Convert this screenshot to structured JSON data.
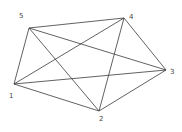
{
  "diagram": {
    "type": "complete-graph",
    "nodes": [
      {
        "id": "1",
        "label": "1",
        "x": 14,
        "y": 84,
        "lx": 9,
        "ly": 98
      },
      {
        "id": "2",
        "label": "2",
        "x": 99,
        "y": 111,
        "lx": 99,
        "ly": 121
      },
      {
        "id": "3",
        "label": "3",
        "x": 166,
        "y": 70,
        "lx": 170,
        "ly": 74
      },
      {
        "id": "4",
        "label": "4",
        "x": 124,
        "y": 18,
        "lx": 129,
        "ly": 19
      },
      {
        "id": "5",
        "label": "5",
        "x": 29,
        "y": 28,
        "lx": 19,
        "ly": 18
      }
    ],
    "edges": [
      [
        "5",
        "4"
      ],
      [
        "5",
        "3"
      ],
      [
        "5",
        "2"
      ],
      [
        "5",
        "1"
      ],
      [
        "4",
        "1"
      ],
      [
        "4",
        "2"
      ],
      [
        "4",
        "3"
      ],
      [
        "3",
        "1"
      ],
      [
        "3",
        "2"
      ],
      [
        "1",
        "2"
      ]
    ],
    "edge_color": "#3a3a3a"
  }
}
